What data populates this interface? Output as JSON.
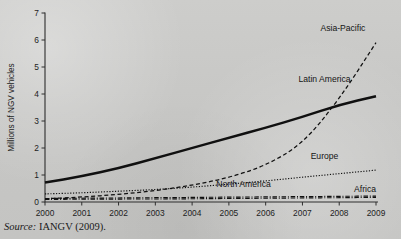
{
  "chart_data": {
    "type": "line",
    "title": "",
    "xlabel": "",
    "ylabel": "Millions of NGV vehicles",
    "x": [
      2000,
      2001,
      2002,
      2003,
      2004,
      2005,
      2006,
      2007,
      2008,
      2009
    ],
    "xticklabels": [
      "2000",
      "2001",
      "2002",
      "2003",
      "2004",
      "2005",
      "2006",
      "2007",
      "2008",
      "2009"
    ],
    "yticklabels": [
      "0",
      "1",
      "2",
      "3",
      "4",
      "5",
      "6",
      "7"
    ],
    "ylim": [
      0,
      7
    ],
    "xlim": [
      2000,
      2009
    ],
    "grid": false,
    "legend_position": "inline-annotations",
    "series": [
      {
        "name": "Latin America",
        "style": "solid-thick",
        "values": [
          0.72,
          0.95,
          1.25,
          1.62,
          2.0,
          2.38,
          2.75,
          3.15,
          3.6,
          3.92
        ]
      },
      {
        "name": "Asia-Pacific",
        "style": "dashed",
        "values": [
          0.12,
          0.18,
          0.28,
          0.42,
          0.62,
          0.9,
          1.35,
          2.15,
          3.8,
          5.9
        ]
      },
      {
        "name": "Europe",
        "style": "dotted",
        "values": [
          0.3,
          0.34,
          0.4,
          0.46,
          0.55,
          0.66,
          0.78,
          0.92,
          1.05,
          1.18
        ]
      },
      {
        "name": "North America",
        "style": "dash-dot",
        "values": [
          0.13,
          0.14,
          0.15,
          0.16,
          0.17,
          0.18,
          0.19,
          0.2,
          0.21,
          0.22
        ]
      },
      {
        "name": "Africa",
        "style": "dash-dot",
        "values": [
          0.1,
          0.1,
          0.11,
          0.11,
          0.12,
          0.13,
          0.14,
          0.15,
          0.16,
          0.17
        ]
      }
    ],
    "annotations": [
      {
        "text": "Asia-Pacific",
        "x": 2008.1,
        "y": 6.35
      },
      {
        "text": "Latin America",
        "x": 2007.6,
        "y": 4.45
      },
      {
        "text": "Europe",
        "x": 2007.6,
        "y": 1.6
      },
      {
        "text": "North America",
        "x": 2005.4,
        "y": 0.55
      },
      {
        "text": "Africa",
        "x": 2009.0,
        "y": 0.38
      }
    ]
  },
  "source": {
    "prefix": "Source:",
    "text": "IANGV (2009)."
  },
  "colors": {
    "paper": "#c8c8c6",
    "ink": "#101010",
    "axis": "#2e2e2e"
  }
}
